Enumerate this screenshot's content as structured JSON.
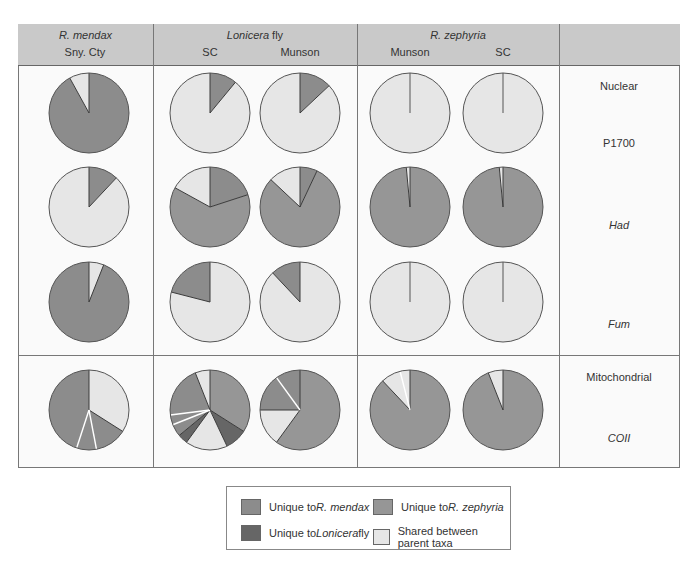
{
  "colors": {
    "mendax": "#8c8c8c",
    "zephyria": "#969696",
    "lonicera": "#666666",
    "shared": "#e6e6e6",
    "header_bg": "#c9c9c9",
    "divider": "#ffffff",
    "outline": "#555555"
  },
  "header": {
    "columns": [
      {
        "taxon": "R. mendax",
        "taxon_italic": "R. mendax",
        "taxon_suffix": "",
        "sites": [
          "Sny. Cty"
        ]
      },
      {
        "taxon": "Lonicera fly",
        "taxon_italic": "Lonicera",
        "taxon_suffix": " fly",
        "sites": [
          "SC",
          "Munson"
        ]
      },
      {
        "taxon": "R. zephyria",
        "taxon_italic": "R. zephyria",
        "taxon_suffix": "",
        "sites": [
          "Munson",
          "SC"
        ]
      },
      {
        "taxon": "",
        "sites": []
      }
    ]
  },
  "row_labels": {
    "nuclear": "Nuclear",
    "p1700": "P1700",
    "had": "Had",
    "fum": "Fum",
    "mitochondrial": "Mitochondrial",
    "coii": "COII"
  },
  "legend": {
    "items": [
      {
        "key": "mendax",
        "prefix": "Unique to ",
        "italic": "R. mendax",
        "suffix": ""
      },
      {
        "key": "zephyria",
        "prefix": "Unique to ",
        "italic": "R. zephyria",
        "suffix": ""
      },
      {
        "key": "lonicera",
        "prefix": "Unique to ",
        "italic": "Lonicera",
        "suffix": " fly"
      },
      {
        "key": "shared",
        "prefix": "Shared between parent taxa",
        "italic": "",
        "suffix": ""
      }
    ]
  },
  "chart_data": {
    "type": "pie",
    "title": "",
    "legend": [
      "Unique to R. mendax",
      "Unique to R. zephyria",
      "Unique to Lonicera fly",
      "Shared between parent taxa"
    ],
    "columns": [
      "R. mendax Sny. Cty",
      "Lonicera fly SC",
      "Lonicera fly Munson",
      "R. zephyria Munson",
      "R. zephyria SC"
    ],
    "rows": [
      "P1700",
      "Had",
      "Fum",
      "COII"
    ],
    "pies": [
      {
        "row": "P1700",
        "col": "R. mendax Sny. Cty",
        "cx": 89,
        "cy": 113,
        "slices": [
          {
            "c": "mendax",
            "v": 92
          },
          {
            "c": "shared",
            "v": 8
          }
        ]
      },
      {
        "row": "P1700",
        "col": "Lonicera fly SC",
        "cx": 210,
        "cy": 113,
        "slices": [
          {
            "c": "mendax",
            "v": 11
          },
          {
            "c": "shared",
            "v": 89
          }
        ]
      },
      {
        "row": "P1700",
        "col": "Lonicera fly Munson",
        "cx": 300,
        "cy": 113,
        "slices": [
          {
            "c": "mendax",
            "v": 13
          },
          {
            "c": "shared",
            "v": 87
          }
        ]
      },
      {
        "row": "P1700",
        "col": "R. zephyria Munson",
        "cx": 410,
        "cy": 113,
        "slices": [
          {
            "c": "shared",
            "v": 100
          }
        ],
        "line": true
      },
      {
        "row": "P1700",
        "col": "R. zephyria SC",
        "cx": 503,
        "cy": 113,
        "slices": [
          {
            "c": "shared",
            "v": 100
          }
        ],
        "line": true
      },
      {
        "row": "Had",
        "col": "R. mendax Sny. Cty",
        "cx": 89,
        "cy": 207,
        "slices": [
          {
            "c": "mendax",
            "v": 12
          },
          {
            "c": "shared",
            "v": 88
          }
        ]
      },
      {
        "row": "Had",
        "col": "Lonicera fly SC",
        "cx": 210,
        "cy": 207,
        "slices": [
          {
            "c": "mendax",
            "v": 20
          },
          {
            "c": "zephyria",
            "v": 63
          },
          {
            "c": "shared",
            "v": 17
          }
        ]
      },
      {
        "row": "Had",
        "col": "Lonicera fly Munson",
        "cx": 300,
        "cy": 207,
        "slices": [
          {
            "c": "mendax",
            "v": 7
          },
          {
            "c": "zephyria",
            "v": 80
          },
          {
            "c": "shared",
            "v": 13
          }
        ]
      },
      {
        "row": "Had",
        "col": "R. zephyria Munson",
        "cx": 410,
        "cy": 207,
        "slices": [
          {
            "c": "zephyria",
            "v": 98.5
          },
          {
            "c": "shared",
            "v": 1.5
          }
        ]
      },
      {
        "row": "Had",
        "col": "R. zephyria SC",
        "cx": 503,
        "cy": 207,
        "slices": [
          {
            "c": "zephyria",
            "v": 98.5
          },
          {
            "c": "shared",
            "v": 1.5
          }
        ]
      },
      {
        "row": "Fum",
        "col": "R. mendax Sny. Cty",
        "cx": 89,
        "cy": 302,
        "slices": [
          {
            "c": "shared",
            "v": 6
          },
          {
            "c": "mendax",
            "v": 94
          }
        ]
      },
      {
        "row": "Fum",
        "col": "Lonicera fly SC",
        "cx": 210,
        "cy": 302,
        "slices": [
          {
            "c": "shared",
            "v": 79
          },
          {
            "c": "mendax",
            "v": 21
          }
        ]
      },
      {
        "row": "Fum",
        "col": "Lonicera fly Munson",
        "cx": 300,
        "cy": 302,
        "slices": [
          {
            "c": "shared",
            "v": 88
          },
          {
            "c": "mendax",
            "v": 12
          }
        ]
      },
      {
        "row": "Fum",
        "col": "R. zephyria Munson",
        "cx": 410,
        "cy": 302,
        "slices": [
          {
            "c": "shared",
            "v": 100
          }
        ],
        "line": true
      },
      {
        "row": "Fum",
        "col": "R. zephyria SC",
        "cx": 503,
        "cy": 302,
        "slices": [
          {
            "c": "shared",
            "v": 100
          }
        ],
        "line": true
      },
      {
        "row": "COII",
        "col": "R. mendax Sny. Cty",
        "cx": 89,
        "cy": 410,
        "slices": [
          {
            "c": "shared",
            "v": 34
          },
          {
            "c": "mendax",
            "v": 13
          },
          {
            "c": "mendax",
            "v": 8
          },
          {
            "c": "mendax",
            "v": 45
          }
        ]
      },
      {
        "row": "COII",
        "col": "Lonicera fly SC",
        "cx": 210,
        "cy": 410,
        "slices": [
          {
            "c": "zephyria",
            "v": 34
          },
          {
            "c": "lonicera",
            "v": 9
          },
          {
            "c": "shared",
            "v": 17
          },
          {
            "c": "lonicera",
            "v": 4
          },
          {
            "c": "mendax",
            "v": 5
          },
          {
            "c": "mendax",
            "v": 4
          },
          {
            "c": "mendax",
            "v": 21
          },
          {
            "c": "shared",
            "v": 6
          }
        ]
      },
      {
        "row": "COII",
        "col": "Lonicera fly Munson",
        "cx": 300,
        "cy": 410,
        "slices": [
          {
            "c": "zephyria",
            "v": 60
          },
          {
            "c": "shared",
            "v": 15
          },
          {
            "c": "mendax",
            "v": 15
          },
          {
            "c": "mendax",
            "v": 10
          }
        ]
      },
      {
        "row": "COII",
        "col": "R. zephyria Munson",
        "cx": 410,
        "cy": 410,
        "slices": [
          {
            "c": "zephyria",
            "v": 88
          },
          {
            "c": "shared",
            "v": 8
          },
          {
            "c": "shared",
            "v": 4
          }
        ]
      },
      {
        "row": "COII",
        "col": "R. zephyria SC",
        "cx": 503,
        "cy": 410,
        "slices": [
          {
            "c": "zephyria",
            "v": 94
          },
          {
            "c": "shared",
            "v": 6
          }
        ]
      }
    ],
    "radius": 40
  }
}
